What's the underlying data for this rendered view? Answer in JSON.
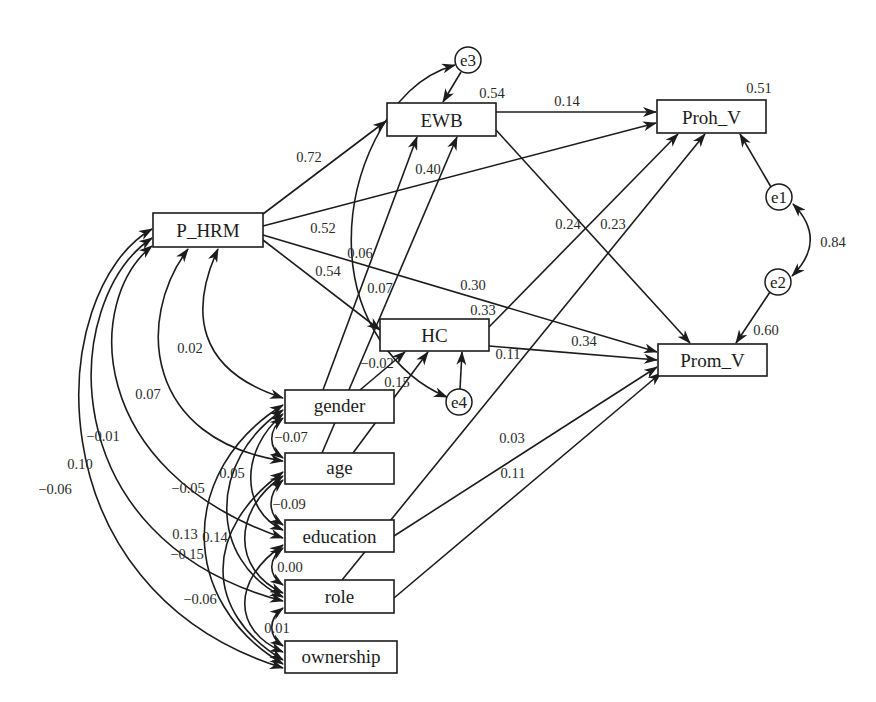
{
  "diagram": {
    "type": "path_diagram",
    "nodes": {
      "p_hrm": {
        "label": "P_HRM"
      },
      "ewb": {
        "label": "EWB",
        "r2": "0.54"
      },
      "hc": {
        "label": "HC",
        "r2": "0.33"
      },
      "proh_v": {
        "label": "Proh_V",
        "r2": "0.51"
      },
      "prom_v": {
        "label": "Prom_V",
        "r2": "0.60"
      },
      "gender": {
        "label": "gender"
      },
      "age": {
        "label": "age"
      },
      "education": {
        "label": "education"
      },
      "role": {
        "label": "role"
      },
      "ownership": {
        "label": "ownership"
      }
    },
    "errors": {
      "e1": {
        "label": "e1",
        "target": "Proh_V"
      },
      "e2": {
        "label": "e2",
        "target": "Prom_V"
      },
      "e3": {
        "label": "e3",
        "target": "EWB"
      },
      "e4": {
        "label": "e4",
        "target": "HC"
      }
    },
    "paths": [
      {
        "from": "P_HRM",
        "to": "EWB",
        "coef": "0.72"
      },
      {
        "from": "P_HRM",
        "to": "Proh_V",
        "coef": "0.52"
      },
      {
        "from": "P_HRM",
        "to": "HC",
        "coef": "0.54"
      },
      {
        "from": "P_HRM",
        "to": "Prom_V",
        "coef": "0.30"
      },
      {
        "from": "EWB",
        "to": "Proh_V",
        "coef": "0.14"
      },
      {
        "from": "EWB",
        "to": "Prom_V",
        "coef": "0.24"
      },
      {
        "from": "HC",
        "to": "Proh_V",
        "coef": "0.23"
      },
      {
        "from": "HC",
        "to": "Prom_V",
        "coef": "0.34"
      },
      {
        "from": "gender",
        "to": "EWB",
        "coef": "0.40"
      },
      {
        "from": "age",
        "to": "EWB",
        "coef": "0.06"
      },
      {
        "from": "gender",
        "to": "HC",
        "coef": "0.15"
      },
      {
        "from": "age",
        "to": "HC",
        "coef": "0.07"
      },
      {
        "from": "education",
        "to": "Prom_V",
        "coef": "0.03"
      },
      {
        "from": "role",
        "to": "Proh_V",
        "coef": "0.11"
      },
      {
        "from": "role",
        "to": "Prom_V",
        "coef": "0.11"
      },
      {
        "from": "e1",
        "to": "Proh_V",
        "coef": ""
      },
      {
        "from": "e2",
        "to": "Prom_V",
        "coef": ""
      },
      {
        "from": "e3",
        "to": "EWB",
        "coef": ""
      },
      {
        "from": "e4",
        "to": "HC",
        "coef": ""
      }
    ],
    "covariances": [
      {
        "a": "e1",
        "b": "e2",
        "coef": "0.84"
      },
      {
        "a": "e3",
        "b": "e4",
        "coef": "−0.02"
      },
      {
        "a": "P_HRM",
        "b": "gender",
        "coef": "0.02"
      },
      {
        "a": "P_HRM",
        "b": "age",
        "coef": "0.07"
      },
      {
        "a": "P_HRM",
        "b": "education",
        "coef": "−0.01"
      },
      {
        "a": "P_HRM",
        "b": "role",
        "coef": "0.10"
      },
      {
        "a": "P_HRM",
        "b": "ownership",
        "coef": "−0.06"
      },
      {
        "a": "gender",
        "b": "age",
        "coef": "−0.07"
      },
      {
        "a": "age",
        "b": "education",
        "coef": "−0.09"
      },
      {
        "a": "education",
        "b": "role",
        "coef": "0.00"
      },
      {
        "a": "role",
        "b": "ownership",
        "coef": "0.01"
      },
      {
        "a": "gender",
        "b": "education",
        "coef": "0.05"
      },
      {
        "a": "age",
        "b": "role",
        "coef": "0.13"
      },
      {
        "a": "education",
        "b": "ownership",
        "coef": "0.14"
      },
      {
        "a": "gender",
        "b": "role",
        "coef": "−0.05"
      },
      {
        "a": "age",
        "b": "ownership",
        "coef": "−0.15"
      },
      {
        "a": "gender",
        "b": "ownership",
        "coef": "−0.06"
      }
    ],
    "colors": {
      "line": "#1c1c1c",
      "background": "#ffffff"
    }
  }
}
